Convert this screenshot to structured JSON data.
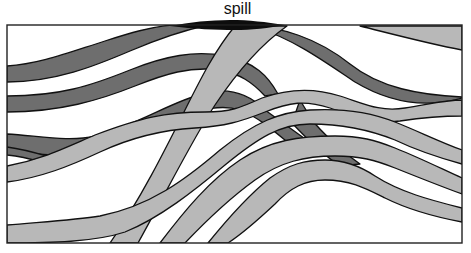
{
  "figure": {
    "annotation_label": "spill",
    "width": 471,
    "height": 253
  },
  "colors": {
    "dark_layer": "#6e6e6e",
    "light_layer": "#b8b8b8",
    "spill": "#0d0d0d",
    "outline": "#111111",
    "background": "#ffffff"
  },
  "layers": {
    "dark": [
      {
        "name": "dark-layer-1",
        "d": "M7,66 C40,64 70,52 105,41 C130,33 150,27 172,25 L208,25 C185,30 160,38 130,51 C95,66 55,82 7,82 Z"
      },
      {
        "name": "dark-layer-1-right",
        "d": "M238,26 C280,24 320,40 350,64 C380,88 420,95 462,97 L462,98 C420,110 385,100 355,82 C325,62 295,40 258,28 Z"
      },
      {
        "name": "dark-layer-2",
        "d": "M7,96 C60,96 90,86 130,70 C165,56 195,50 225,56 C255,62 268,76 278,94 L265,96 C252,82 240,74 220,70 C190,66 165,74 135,86 C100,100 60,112 7,112 Z"
      },
      {
        "name": "dark-layer-3",
        "d": "M7,134 C40,136 70,142 95,136 C140,124 170,102 205,93 C230,87 250,95 265,110 L308,141 L292,146 C275,132 260,118 240,110 C215,102 185,114 150,130 C120,144 95,154 60,155 C40,155 25,152 7,150 Z"
      },
      {
        "name": "dark-layer-3-crossing",
        "d": "M300,100 L312,120 C320,130 340,150 360,164 L340,166 C325,156 308,140 292,123 Z"
      },
      {
        "name": "dark-layer-4",
        "d": "M7,147 C30,150 45,156 60,160 L40,162 C28,158 18,156 7,155 Z"
      }
    ],
    "light": [
      {
        "name": "light-layer-1",
        "d": "M110,243 C140,200 165,150 185,110 C200,80 215,50 235,26 L287,26 C260,45 235,75 215,105 C195,135 170,185 138,243 Z"
      },
      {
        "name": "light-layer-2",
        "d": "M7,166 C40,160 60,150 95,135 C140,118 165,112 205,112 C230,112 240,108 262,98 C290,88 315,88 340,96 C365,104 380,112 405,108 C430,104 445,100 462,100 L462,116 C440,116 420,118 400,121 C375,124 355,116 330,108 C305,100 290,102 265,112 C240,122 225,126 195,128 C160,130 130,138 100,152 C70,166 40,178 7,182 Z"
      },
      {
        "name": "light-layer-3",
        "d": "M7,225 C40,222 75,220 100,216 C150,206 185,180 220,150 C255,122 280,112 310,110 C345,108 375,114 395,122 C420,132 440,142 462,150 L462,164 C440,158 420,152 395,140 C370,130 345,124 310,124 C280,124 258,138 225,165 C195,190 160,218 125,232 C95,242 50,243 7,243 Z"
      },
      {
        "name": "light-layer-4",
        "d": "M160,243 C185,210 210,180 240,160 C270,140 300,136 335,136 C360,136 375,140 395,148 C420,158 440,168 462,178 L462,194 C440,186 420,178 395,168 C375,160 360,156 335,156 C305,156 280,162 255,180 C230,198 205,222 185,243 Z"
      },
      {
        "name": "light-layer-5",
        "d": "M208,243 C225,222 245,198 270,178 C290,164 305,160 325,160 C345,160 360,166 375,176 C400,192 430,200 462,208 L462,222 C430,216 405,208 385,198 C365,188 350,180 325,180 C305,180 290,188 275,204 C260,218 245,232 228,243 Z"
      },
      {
        "name": "light-layer-top-right",
        "d": "M360,26 L462,26 L462,50 C430,44 400,36 360,26 Z"
      }
    ],
    "spill": {
      "name": "spill-zone",
      "d": "M170,26 C190,22 210,20 230,20 C250,20 265,22 285,25 C270,28 250,30 235,30 C215,30 195,29 170,26 Z"
    }
  },
  "frame": {
    "x": 7,
    "y": 25,
    "width": 455,
    "height": 218
  }
}
